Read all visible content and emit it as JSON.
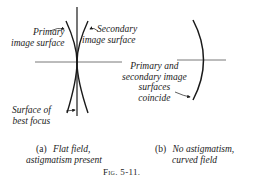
{
  "figure": {
    "number": "Fig. 5-11.",
    "panel_a": {
      "tag": "(a)",
      "caption_line1": "Flat field,",
      "caption_line2": "astigmatism present",
      "labels": {
        "primary_line1": "Primary",
        "primary_line2": "image surface",
        "secondary_line1": "Secondary",
        "secondary_line2": "image surface",
        "best_focus_line1": "Surface of",
        "best_focus_line2": "best focus"
      }
    },
    "panel_b": {
      "tag": "(b)",
      "caption_line1": "No astigmatism,",
      "caption_line2": "curved field",
      "labels": {
        "coincide_line1": "Primary and",
        "coincide_line2": "secondary image",
        "coincide_line3": "surfaces",
        "coincide_line4": "coincide"
      }
    }
  },
  "colors": {
    "ink": "#1a1a1a",
    "axis": "#555555",
    "background": "#ffffff"
  }
}
